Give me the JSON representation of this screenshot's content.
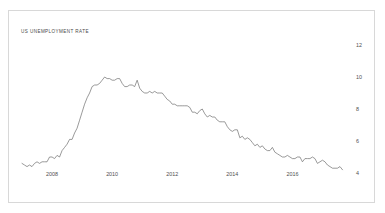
{
  "chart_data": {
    "type": "line",
    "title": "US UNEMPLOYMENT RATE",
    "xlabel": "",
    "ylabel": "",
    "grid": false,
    "legend": "none",
    "accent_color": "#6e6e6e",
    "frame_color": "#d8d8d8",
    "background": "#ffffff",
    "ylim": [
      3.4,
      12.6
    ],
    "yticks": [
      12,
      10,
      8,
      6,
      4
    ],
    "ytick_labels": [
      "12",
      "10",
      "8",
      "6",
      "4"
    ],
    "ytick_position": "right",
    "xlim": [
      2007.0,
      2017.75
    ],
    "xticks": [
      2008,
      2010,
      2012,
      2014,
      2016
    ],
    "xtick_labels": [
      "2008",
      "2010",
      "2012",
      "2014",
      "2016"
    ],
    "x": [
      2007.0,
      2007.083,
      2007.167,
      2007.25,
      2007.333,
      2007.417,
      2007.5,
      2007.583,
      2007.667,
      2007.75,
      2007.833,
      2007.917,
      2008.0,
      2008.083,
      2008.167,
      2008.25,
      2008.333,
      2008.417,
      2008.5,
      2008.583,
      2008.667,
      2008.75,
      2008.833,
      2008.917,
      2009.0,
      2009.083,
      2009.167,
      2009.25,
      2009.333,
      2009.417,
      2009.5,
      2009.583,
      2009.667,
      2009.75,
      2009.833,
      2009.917,
      2010.0,
      2010.083,
      2010.167,
      2010.25,
      2010.333,
      2010.417,
      2010.5,
      2010.583,
      2010.667,
      2010.75,
      2010.833,
      2010.917,
      2011.0,
      2011.083,
      2011.167,
      2011.25,
      2011.333,
      2011.417,
      2011.5,
      2011.583,
      2011.667,
      2011.75,
      2011.833,
      2011.917,
      2012.0,
      2012.083,
      2012.167,
      2012.25,
      2012.333,
      2012.417,
      2012.5,
      2012.583,
      2012.667,
      2012.75,
      2012.833,
      2012.917,
      2013.0,
      2013.083,
      2013.167,
      2013.25,
      2013.333,
      2013.417,
      2013.5,
      2013.583,
      2013.667,
      2013.75,
      2013.833,
      2013.917,
      2014.0,
      2014.083,
      2014.167,
      2014.25,
      2014.333,
      2014.417,
      2014.5,
      2014.583,
      2014.667,
      2014.75,
      2014.833,
      2014.917,
      2015.0,
      2015.083,
      2015.167,
      2015.25,
      2015.333,
      2015.417,
      2015.5,
      2015.583,
      2015.667,
      2015.75,
      2015.833,
      2015.917,
      2016.0,
      2016.083,
      2016.167,
      2016.25,
      2016.333,
      2016.417,
      2016.5,
      2016.583,
      2016.667,
      2016.75,
      2016.833,
      2016.917,
      2017.0,
      2017.083,
      2017.167,
      2017.25,
      2017.333,
      2017.417,
      2017.5,
      2017.583,
      2017.667
    ],
    "values": [
      4.6,
      4.5,
      4.4,
      4.5,
      4.4,
      4.6,
      4.7,
      4.6,
      4.7,
      4.7,
      4.7,
      5.0,
      5.0,
      4.9,
      5.1,
      5.0,
      5.4,
      5.6,
      5.8,
      6.1,
      6.1,
      6.5,
      6.8,
      7.3,
      7.8,
      8.3,
      8.7,
      9.0,
      9.4,
      9.5,
      9.5,
      9.6,
      9.8,
      10.0,
      9.9,
      9.9,
      9.8,
      9.8,
      9.9,
      9.9,
      9.6,
      9.4,
      9.4,
      9.5,
      9.5,
      9.4,
      9.8,
      9.3,
      9.1,
      9.0,
      9.0,
      9.1,
      9.0,
      9.1,
      9.0,
      9.0,
      9.0,
      8.8,
      8.6,
      8.5,
      8.3,
      8.3,
      8.2,
      8.2,
      8.2,
      8.2,
      8.2,
      8.1,
      7.8,
      7.8,
      7.7,
      7.9,
      8.0,
      7.7,
      7.5,
      7.6,
      7.5,
      7.5,
      7.3,
      7.2,
      7.2,
      7.2,
      6.9,
      6.7,
      6.6,
      6.7,
      6.7,
      6.2,
      6.3,
      6.1,
      6.2,
      6.1,
      5.9,
      5.7,
      5.8,
      5.6,
      5.7,
      5.5,
      5.4,
      5.4,
      5.6,
      5.3,
      5.2,
      5.1,
      5.0,
      5.0,
      5.1,
      5.0,
      4.9,
      4.9,
      5.0,
      5.0,
      4.7,
      4.9,
      4.9,
      4.9,
      5.0,
      4.9,
      4.6,
      4.7,
      4.8,
      4.7,
      4.5,
      4.4,
      4.3,
      4.3,
      4.3,
      4.4,
      4.2
    ]
  }
}
